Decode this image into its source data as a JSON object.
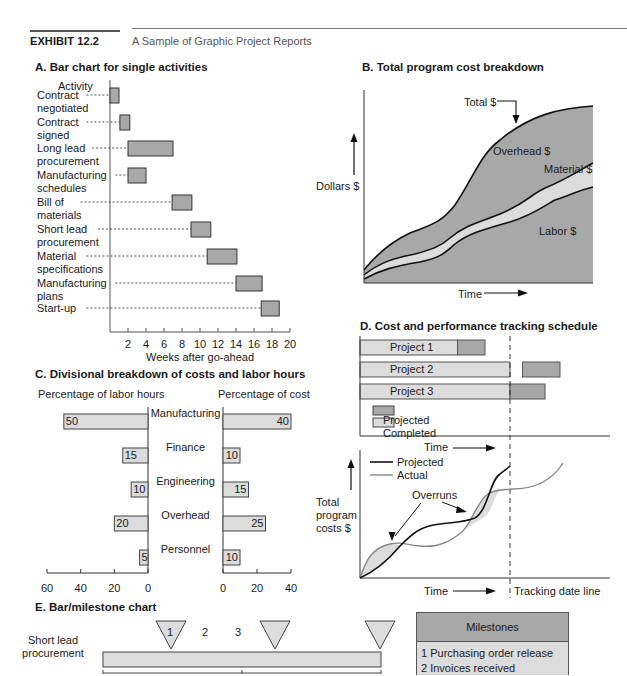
{
  "header": {
    "exhibit": "EXHIBIT 12.2",
    "subtitle": "A Sample of Graphic Project Reports"
  },
  "colors": {
    "dark_fill": "#a8a8a8",
    "light_fill": "#dcdcdc",
    "stroke": "#222222",
    "actual_line": "#888888"
  },
  "chart_data": [
    {
      "id": "A",
      "type": "bar",
      "title": "A. Bar chart for single activities",
      "ylabel": "Activity",
      "xlabel": "Weeks after go-ahead",
      "xlim": [
        0,
        20
      ],
      "xticks": [
        2,
        4,
        6,
        8,
        10,
        12,
        14,
        16,
        18,
        20
      ],
      "activities": [
        {
          "label": [
            "Contract",
            "negotiated"
          ],
          "start": 0,
          "end": 1
        },
        {
          "label": [
            "Contract",
            "signed"
          ],
          "start": 1.1,
          "end": 2.2
        },
        {
          "label": [
            "Long lead",
            "procurement"
          ],
          "start": 2,
          "end": 7
        },
        {
          "label": [
            "Manufacturing",
            "schedules"
          ],
          "start": 2,
          "end": 4
        },
        {
          "label": [
            "Bill of",
            "materials"
          ],
          "start": 6.9,
          "end": 9.1
        },
        {
          "label": [
            "Short lead",
            "procurement"
          ],
          "start": 9,
          "end": 11.2
        },
        {
          "label": [
            "Material",
            "specifications"
          ],
          "start": 10.8,
          "end": 14.1
        },
        {
          "label": [
            "Manufacturing",
            "plans"
          ],
          "start": 14,
          "end": 16.9
        },
        {
          "label": [
            "Start-up"
          ],
          "start": 16.8,
          "end": 18.8
        }
      ]
    },
    {
      "id": "B",
      "type": "area",
      "title": "B. Total program cost breakdown",
      "xlabel": "Time",
      "ylabel": "Dollars $",
      "series": [
        {
          "name": "Labor $"
        },
        {
          "name": "Material $"
        },
        {
          "name": "Overhead $"
        },
        {
          "name": "Total $"
        }
      ]
    },
    {
      "id": "C",
      "type": "bar",
      "title": "C. Divisional breakdown of costs and labor hours",
      "left_label": "Percentage of labor hours",
      "right_label": "Percentage of cost",
      "left_xlim": [
        0,
        60
      ],
      "right_xlim": [
        0,
        40
      ],
      "left_ticks": [
        "60",
        "40",
        "20",
        "0"
      ],
      "right_ticks": [
        "0",
        "20",
        "40"
      ],
      "categories": [
        "Manufacturing",
        "Finance",
        "Engineering",
        "Overhead",
        "Personnel"
      ],
      "series": [
        {
          "name": "Percentage of labor hours",
          "values": [
            50,
            15,
            10,
            20,
            5
          ]
        },
        {
          "name": "Percentage of cost",
          "values": [
            40,
            10,
            15,
            25,
            10
          ]
        }
      ]
    },
    {
      "id": "D",
      "type": "bar",
      "title": "D. Cost and performance tracking schedule",
      "xlabel": "Time",
      "tracking_label": "Tracking date line",
      "tracking_date": 0.6,
      "projects": [
        {
          "name": "Project 1",
          "completed": [
            0,
            0.39
          ],
          "projected": [
            0.39,
            0.5
          ]
        },
        {
          "name": "Project 2",
          "completed": [
            0,
            0.6
          ],
          "projected": [
            0.65,
            0.8
          ]
        },
        {
          "name": "Project 3",
          "completed": [
            0,
            0.6
          ],
          "projected": [
            0.6,
            0.74
          ]
        }
      ],
      "legend": [
        "Projected",
        "Completed"
      ]
    },
    {
      "id": "D2",
      "type": "line",
      "xlabel": "Time",
      "ylabel": "Total program costs $",
      "legend": [
        "Projected",
        "Actual"
      ],
      "annotation": "Overruns"
    },
    {
      "id": "E",
      "type": "table",
      "title": "E. Bar/milestone chart",
      "activity": [
        "Short lead",
        "procurement"
      ],
      "milestone_numbers": [
        "1",
        "2",
        "3"
      ],
      "milestones_header": "Milestones",
      "milestones": [
        "1 Purchasing order release",
        "2 Invoices received"
      ]
    }
  ]
}
